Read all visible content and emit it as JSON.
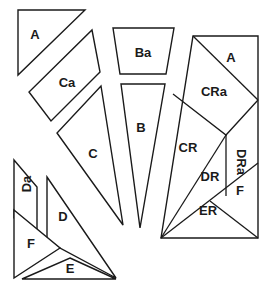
{
  "diagram": {
    "colors": {
      "stroke": "#1a1a1a",
      "fill": "#ffffff",
      "background": "#ffffff"
    },
    "pieces": [
      {
        "id": "A",
        "label": "A",
        "points": "18,10 85,10 18,75",
        "label_pos": [
          35,
          34
        ]
      },
      {
        "id": "Ca",
        "label": "Ca",
        "points": "92,30 100,72 51,121 29,92",
        "label_pos": [
          67,
          82
        ]
      },
      {
        "id": "C",
        "label": "C",
        "points": "101,86 123,225 57,133",
        "label_pos": [
          93,
          153
        ]
      },
      {
        "id": "Ba",
        "label": "Ba",
        "points": "113,28 174,28 166,74 120,74",
        "label_pos": [
          143,
          52
        ]
      },
      {
        "id": "B",
        "label": "B",
        "points": "121,84 165,84 140,228",
        "label_pos": [
          141,
          127
        ]
      },
      {
        "id": "Da",
        "label": "Da",
        "points": "14,160 37,187 37,236 14,218",
        "label_pos": [
          26,
          184
        ],
        "label_rotate": -90
      },
      {
        "id": "D",
        "label": "D",
        "points": "47,177 116,278 47,241",
        "label_pos": [
          63,
          216
        ]
      },
      {
        "id": "F",
        "label": "F",
        "points": "14,210 60,248 14,278",
        "label_pos": [
          31,
          243
        ]
      },
      {
        "id": "E",
        "label": "E",
        "points": "70,258 116,279 22,279",
        "label_pos": [
          70,
          268
        ]
      }
    ],
    "assembly": {
      "outline": "193,36 258,36 258,238 161,238",
      "seams": [
        {
          "id": "A-CRa",
          "points": "193,36 258,100"
        },
        {
          "id": "CRa-CR",
          "points": "173,94 226,135 258,100"
        },
        {
          "id": "CR-DR",
          "points": "161,238 226,135"
        },
        {
          "id": "DR-DRa",
          "points": "226,135 226,196"
        },
        {
          "id": "DR-ER",
          "points": "161,238 258,163"
        },
        {
          "id": "ER-F",
          "points": "210,201 258,238"
        }
      ],
      "labels": [
        {
          "id": "A",
          "text": "A",
          "pos": [
            231,
            57
          ]
        },
        {
          "id": "CRa",
          "text": "CRa",
          "pos": [
            214,
            91
          ]
        },
        {
          "id": "CR",
          "text": "CR",
          "pos": [
            188,
            147
          ]
        },
        {
          "id": "DRa",
          "text": "DRa",
          "pos": [
            241,
            162
          ],
          "rotate": 90
        },
        {
          "id": "DR",
          "text": "DR",
          "pos": [
            210,
            176
          ]
        },
        {
          "id": "F",
          "text": "F",
          "pos": [
            240,
            190
          ]
        },
        {
          "id": "ER",
          "text": "ER",
          "pos": [
            208,
            210
          ]
        }
      ]
    }
  }
}
